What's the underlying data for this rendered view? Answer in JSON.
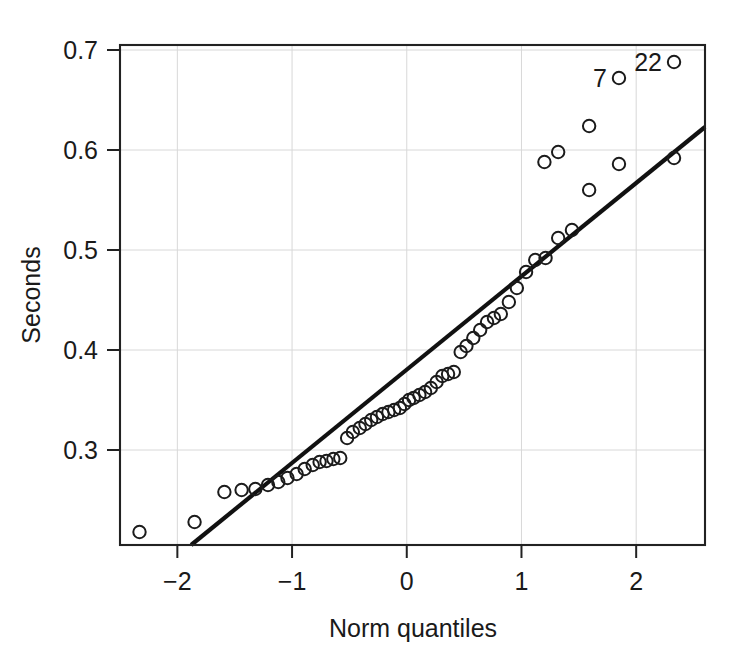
{
  "chart_data": {
    "type": "scatter",
    "title": "",
    "subtitle": "",
    "xlabel": "Norm quantiles",
    "ylabel": "Seconds",
    "xlim": [
      -2.5,
      2.6
    ],
    "ylim": [
      0.205,
      0.705
    ],
    "xticks": [
      -2,
      -1,
      0,
      1,
      2
    ],
    "xticklabels": [
      "−2",
      "−1",
      "0",
      "1",
      "2"
    ],
    "yticks": [
      0.3,
      0.4,
      0.5,
      0.6,
      0.7
    ],
    "yticklabels": [
      "0.3",
      "0.4",
      "0.5",
      "0.6",
      "0.7"
    ],
    "grid": true,
    "legend": null,
    "marker": "open-circle",
    "series": [
      {
        "name": "sample quantiles",
        "x": [
          -2.33,
          -1.85,
          -1.59,
          -1.44,
          -1.32,
          -1.21,
          -1.12,
          -1.04,
          -0.96,
          -0.89,
          -0.82,
          -0.76,
          -0.7,
          -0.64,
          -0.58,
          -0.52,
          -0.47,
          -0.41,
          -0.36,
          -0.31,
          -0.26,
          -0.21,
          -0.16,
          -0.11,
          -0.06,
          -0.02,
          0.02,
          0.06,
          0.11,
          0.16,
          0.21,
          0.26,
          0.31,
          0.36,
          0.41,
          0.47,
          0.52,
          0.58,
          0.64,
          0.7,
          0.76,
          0.82,
          0.89,
          0.96,
          1.04,
          1.12,
          1.21,
          1.32,
          1.44,
          1.59,
          1.85,
          2.33
        ],
        "y": [
          0.218,
          0.228,
          0.258,
          0.26,
          0.261,
          0.265,
          0.268,
          0.272,
          0.276,
          0.281,
          0.285,
          0.288,
          0.289,
          0.291,
          0.292,
          0.312,
          0.318,
          0.322,
          0.326,
          0.33,
          0.333,
          0.336,
          0.338,
          0.34,
          0.342,
          0.346,
          0.35,
          0.352,
          0.355,
          0.358,
          0.362,
          0.368,
          0.374,
          0.376,
          0.378,
          0.398,
          0.404,
          0.412,
          0.42,
          0.428,
          0.432,
          0.436,
          0.448,
          0.462,
          0.478,
          0.49,
          0.492,
          0.512,
          0.52,
          0.56,
          0.586,
          0.592
        ]
      }
    ],
    "outliers_labeled": [
      {
        "label": "7",
        "x": 1.85,
        "y": 0.672
      },
      {
        "label": "22",
        "x": 2.33,
        "y": 0.688
      }
    ],
    "reference_line": {
      "name": "robust qq line",
      "x0": -1.88,
      "y0": 0.205,
      "x1": 2.6,
      "y1": 0.623
    },
    "extra_points": [
      {
        "x": 1.2,
        "y": 0.588
      },
      {
        "x": 1.32,
        "y": 0.598
      },
      {
        "x": 1.59,
        "y": 0.624
      }
    ]
  },
  "axis": {
    "ylabel_text": "Seconds",
    "xlabel_text": "Norm quantiles"
  }
}
